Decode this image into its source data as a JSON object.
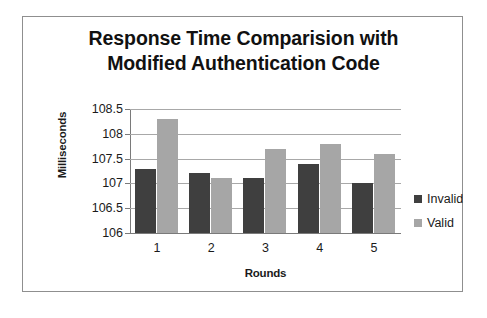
{
  "chart_data": {
    "type": "bar",
    "title": "Response Time Comparision with Modified Authentication Code",
    "title_lines": [
      "Response Time Comparision with",
      "Modified Authentication Code"
    ],
    "xlabel": "Rounds",
    "ylabel": "Milliseconds",
    "categories": [
      "1",
      "2",
      "3",
      "4",
      "5"
    ],
    "ylim": [
      106,
      108.5
    ],
    "ytick_labels": [
      "108.5",
      "108",
      "107.5",
      "107",
      "106.5",
      "106"
    ],
    "ytick_values": [
      108.5,
      108,
      107.5,
      107,
      106.5,
      106
    ],
    "grid": true,
    "legend_position": "right",
    "series": [
      {
        "name": "Invalid",
        "color": "#3f3f3f",
        "values": [
          107.3,
          107.2,
          107.1,
          107.4,
          107.0
        ]
      },
      {
        "name": "Valid",
        "color": "#a6a6a6",
        "values": [
          108.3,
          107.1,
          107.7,
          107.8,
          107.6
        ]
      }
    ]
  },
  "colors": {
    "invalid": "#3f3f3f",
    "valid": "#a6a6a6",
    "gridline": "#a8a8a8",
    "axis": "#7a7a7a",
    "frame": "#8f8f8f",
    "text": "#1a1a1a",
    "background": "#ffffff"
  }
}
